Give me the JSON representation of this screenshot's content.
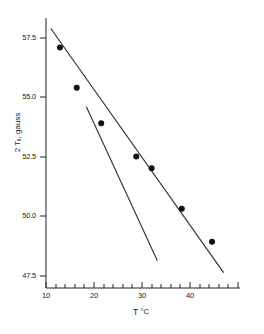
{
  "chart_data": {
    "type": "scatter",
    "title": "",
    "xlabel": "T °C",
    "ylabel": "2 T‖, gauss",
    "ylabel_prefix": "2 T",
    "ylabel_subscript": "‖",
    "ylabel_suffix": ", gauss",
    "xlabel_symbol": "T",
    "xlabel_unit": "°C",
    "xlim": [
      10,
      50
    ],
    "ylim": [
      46.8,
      58.3
    ],
    "grid": false,
    "legend": "none",
    "x_ticks_major": [
      10,
      20,
      30,
      40
    ],
    "x_tick_labels": [
      "10",
      "20",
      "30",
      "40"
    ],
    "x_tick_minor_step": 2,
    "y_ticks_major": [
      57.5,
      55.0,
      52.5,
      50.0,
      47.5
    ],
    "y_tick_labels": [
      "57.5",
      "55.0",
      "52.5",
      "50.0",
      "47.5"
    ],
    "series": [
      {
        "name": "data points",
        "marker": "filled-circle",
        "color": "#101010",
        "x": [
          12.9,
          16.4,
          21.5,
          28.8,
          32.0,
          38.3,
          44.6
        ],
        "y": [
          57.1,
          55.4,
          53.9,
          52.5,
          52.0,
          50.3,
          48.9
        ]
      },
      {
        "name": "upper fit line",
        "type": "line",
        "color": "#2b2b2b",
        "x": [
          11.0,
          47.0
        ],
        "y": [
          57.9,
          47.6
        ]
      },
      {
        "name": "steep fit line",
        "type": "line",
        "color": "#2b2b2b",
        "x": [
          18.4,
          33.2
        ],
        "y": [
          54.6,
          48.1
        ]
      }
    ]
  },
  "axis_geometry": {
    "x_pixel_at_10": 46,
    "x_pixel_per_unit": 4.8,
    "y_pixel_at_57_5": 38,
    "y_pixel_per_unit": 23.7
  }
}
